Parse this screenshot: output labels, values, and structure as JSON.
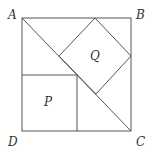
{
  "diagram": {
    "type": "geometry",
    "labels": {
      "A": "A",
      "B": "B",
      "C": "C",
      "D": "D",
      "P": "P",
      "Q": "Q"
    },
    "colors": {
      "line": "#555555",
      "text": "#333333",
      "background": "#ffffff"
    }
  }
}
